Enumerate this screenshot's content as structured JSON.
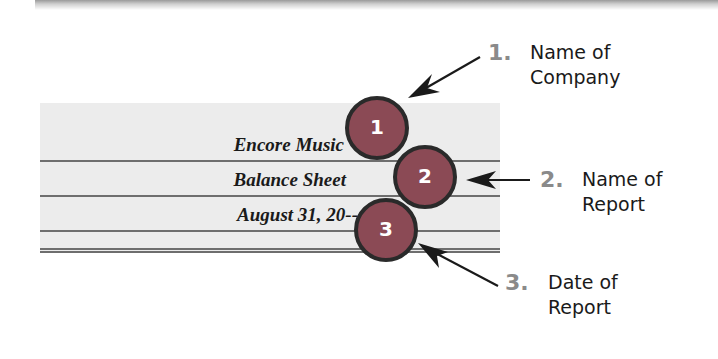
{
  "ledger": {
    "company_name": "Encore Music",
    "report_name": "Balance Sheet",
    "report_date": "August 31, 20--"
  },
  "markers": [
    {
      "number": "1",
      "color": "#8b4a55"
    },
    {
      "number": "2",
      "color": "#8b4a55"
    },
    {
      "number": "3",
      "color": "#8b4a55"
    }
  ],
  "callouts": [
    {
      "number": "1.",
      "line1": "Name of",
      "line2": "Company"
    },
    {
      "number": "2.",
      "line1": "Name of",
      "line2": "Report"
    },
    {
      "number": "3.",
      "line1": "Date of",
      "line2": "Report"
    }
  ],
  "colors": {
    "marker_fill": "#8b4a55",
    "marker_stroke": "#2a2a2a",
    "callout_number": "#8a8a8a",
    "ledger_background": "#ececec"
  }
}
